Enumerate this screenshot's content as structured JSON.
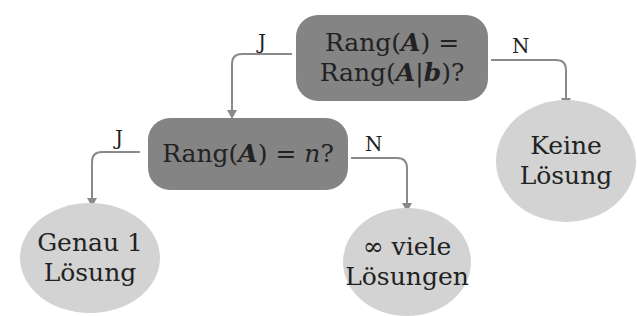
{
  "nodes": {
    "d1": {
      "line1_pre": "Rang(",
      "line1_var": "A",
      "line1_post": ") =",
      "line2_pre": "Rang(",
      "line2_var": "A",
      "line2_bar": "|",
      "line2_var2": "b",
      "line2_post": ")?"
    },
    "d2": {
      "pre": "Rang(",
      "var": "A",
      "mid": ") = ",
      "n": "n",
      "post": "?"
    },
    "leaf_none": {
      "line1": "Keine",
      "line2": "Lösung"
    },
    "leaf_one": {
      "line1": "Genau 1",
      "line2": "Lösung"
    },
    "leaf_inf": {
      "line1": "∞ viele",
      "line2": "Lösungen"
    }
  },
  "edges": {
    "d1_yes": "J",
    "d1_no": "N",
    "d2_yes": "J",
    "d2_no": "N"
  },
  "colors": {
    "decision": "#848484",
    "leaf": "#d3d3d3",
    "edge": "#8a8a8a"
  }
}
